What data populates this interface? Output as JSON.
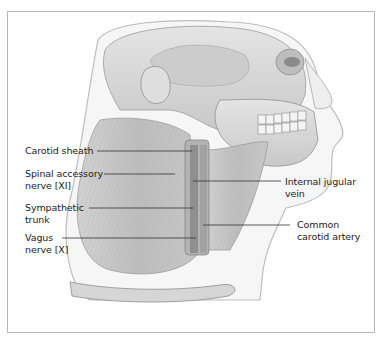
{
  "figure": {
    "colors": {
      "frame": "#b8b8b8",
      "text": "#222222",
      "leader": "#333333",
      "background": "#ffffff"
    },
    "labels_left": [
      {
        "id": "carotid-sheath",
        "lines": [
          "Carotid sheath"
        ]
      },
      {
        "id": "spinal-accessory-nerve",
        "lines": [
          "Spinal accessory",
          "nerve [XI]"
        ]
      },
      {
        "id": "sympathetic-trunk",
        "lines": [
          "Sympathetic",
          "trunk"
        ]
      },
      {
        "id": "vagus-nerve",
        "lines": [
          "Vagus",
          "nerve [X]"
        ]
      }
    ],
    "labels_right": [
      {
        "id": "internal-jugular-vein",
        "lines": [
          "Internal jugular",
          "vein"
        ]
      },
      {
        "id": "common-carotid-artery",
        "lines": [
          "Common",
          "carotid artery"
        ]
      }
    ]
  }
}
